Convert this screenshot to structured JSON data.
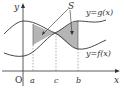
{
  "diagram": {
    "axes": {
      "x_label": "x",
      "y_label": "y",
      "origin_label": "O"
    },
    "curves": [
      {
        "name": "g",
        "label": "y=g(x)"
      },
      {
        "name": "f",
        "label": "y=f(x)"
      }
    ],
    "region_label": "S",
    "x_ticks": [
      "a",
      "c",
      "b"
    ],
    "colors": {
      "shade": "#b5b5b5",
      "line": "#333333",
      "dash": "#777777"
    }
  }
}
